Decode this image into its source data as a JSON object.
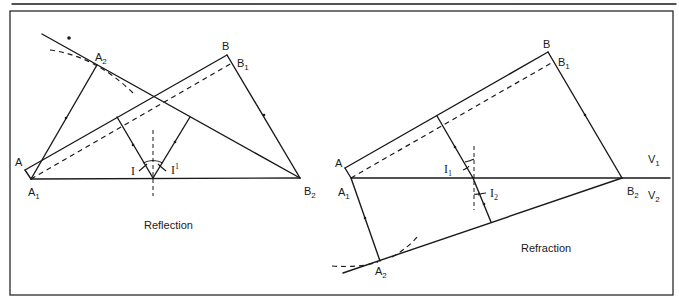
{
  "figure": {
    "panels": [
      {
        "id": "reflection",
        "caption": "Reflection",
        "labels": {
          "A": "A",
          "A1_main": "A",
          "A1_sub": "1",
          "A2_main": "A",
          "A2_sub": "2",
          "B": "B",
          "B1_main": "B",
          "B1_sub": "1",
          "B2_main": "B",
          "B2_sub": "2",
          "angle_incidence": "I",
          "angle_reflection_main": "I",
          "angle_reflection_sup": "1"
        }
      },
      {
        "id": "refraction",
        "caption": "Refraction",
        "labels": {
          "A": "A",
          "A1_main": "A",
          "A1_sub": "1",
          "A2_main": "A",
          "A2_sub": "2",
          "B": "B",
          "B1_main": "B",
          "B1_sub": "1",
          "B2_main": "B",
          "B2_sub": "2",
          "angle_incidence_main": "I",
          "angle_incidence_sub": "1",
          "angle_refraction_main": "I",
          "angle_refraction_sub": "2",
          "V1_main": "V",
          "V1_sub": "1",
          "V2_main": "V",
          "V2_sub": "2"
        }
      }
    ]
  }
}
